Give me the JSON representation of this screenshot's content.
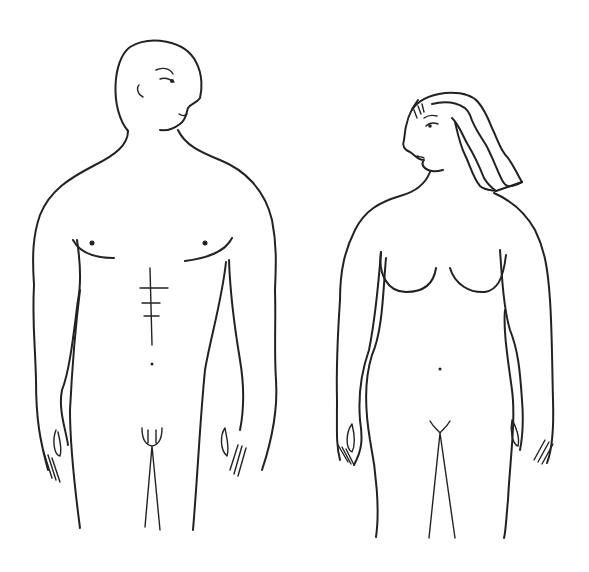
{
  "image": {
    "kind": "line-drawing",
    "background": "#ffffff",
    "stroke_color": "#222222",
    "figures": [
      {
        "id": "male",
        "description": "Nude male figure, front view, bald head turned to the right"
      },
      {
        "id": "female",
        "description": "Nude female figure, front view, wavy hair, head turned to the left"
      }
    ]
  }
}
